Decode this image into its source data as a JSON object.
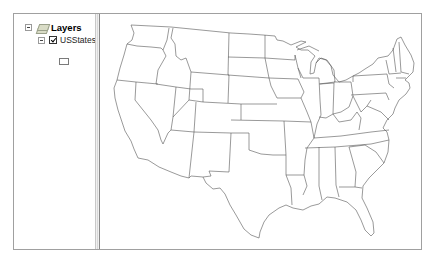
{
  "toc": {
    "root": {
      "label": "Layers",
      "icon": "layers-icon",
      "expanded": true
    },
    "layers": [
      {
        "label": "USStates",
        "checked": true,
        "expanded": true,
        "symbol": {
          "fill": "#ffffff",
          "outline": "#7a7a7a"
        }
      }
    ]
  },
  "map": {
    "layer": "USStates",
    "fill_color": "#ffffff",
    "outline_color": "#555555",
    "background": "#ffffff"
  }
}
